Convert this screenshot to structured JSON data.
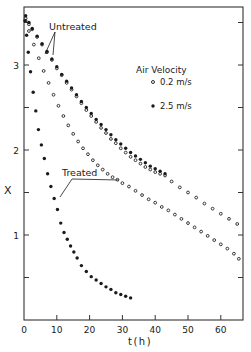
{
  "chart_data": {
    "type": "scatter",
    "title": "",
    "xlabel": "t(h)",
    "ylabel": "X",
    "xlim": [
      0,
      67
    ],
    "ylim": [
      0,
      3.7
    ],
    "xticks": [
      0,
      10,
      20,
      30,
      40,
      50,
      60
    ],
    "xtick_labels": [
      "0",
      "10",
      "20",
      "30",
      "40",
      "50",
      "60"
    ],
    "yticks": [
      0.5,
      1,
      1.5,
      2,
      2.5,
      3,
      3.5
    ],
    "ytick_labels": [
      "",
      "1",
      "",
      "2",
      "",
      "3",
      ""
    ],
    "grid": false,
    "legend": {
      "title": "Air Velocity",
      "position": "upper right",
      "entries": [
        {
          "label": "0.2 m/s",
          "marker": "open-circle"
        },
        {
          "label": "2.5 m/s",
          "marker": "filled-circle"
        }
      ]
    },
    "annotations": [
      {
        "text": "Untreated",
        "points_to": [
          "Untreated 0.2 m/s",
          "Untreated 2.5 m/s"
        ]
      },
      {
        "text": "Treated",
        "points_to": [
          "Treated 0.2 m/s",
          "Treated 2.5 m/s"
        ]
      }
    ],
    "series": [
      {
        "name": "Untreated 0.2 m/s",
        "marker": "open-circle",
        "x": [
          0.5,
          1.5,
          2.5,
          4,
          5.5,
          7,
          8.5,
          10,
          11.5,
          13,
          14.5,
          16,
          17.5,
          19,
          20.5,
          22,
          23.5,
          25,
          26.5,
          28,
          29.5,
          31,
          32.5,
          34,
          35.5,
          37,
          38.5,
          40,
          41.5,
          43,
          45,
          47.5,
          50,
          52.5,
          55,
          57.5,
          60,
          62.5,
          65
        ],
        "y": [
          3.55,
          3.48,
          3.42,
          3.33,
          3.24,
          3.15,
          3.06,
          2.96,
          2.88,
          2.79,
          2.71,
          2.63,
          2.55,
          2.47,
          2.4,
          2.33,
          2.26,
          2.2,
          2.13,
          2.08,
          2.02,
          1.97,
          1.92,
          1.88,
          1.84,
          1.8,
          1.77,
          1.74,
          1.72,
          1.7,
          1.63,
          1.56,
          1.5,
          1.44,
          1.37,
          1.31,
          1.25,
          1.19,
          1.13
        ]
      },
      {
        "name": "Untreated 2.5 m/s",
        "marker": "filled-circle",
        "x": [
          0.5,
          1.5,
          2.5,
          4,
          5.5,
          7,
          8.5,
          10,
          11.5,
          13,
          14.5,
          16,
          17.5,
          19,
          20.5,
          22,
          23.5,
          25,
          26.5,
          28,
          29.5,
          31,
          32.5,
          34,
          35.5,
          37,
          38.5,
          40,
          41.5,
          43
        ],
        "y": [
          3.58,
          3.5,
          3.43,
          3.34,
          3.25,
          3.16,
          3.07,
          2.98,
          2.89,
          2.81,
          2.73,
          2.65,
          2.57,
          2.5,
          2.43,
          2.36,
          2.3,
          2.24,
          2.18,
          2.12,
          2.07,
          2.02,
          1.97,
          1.93,
          1.89,
          1.85,
          1.81,
          1.78,
          1.75,
          1.72
        ]
      },
      {
        "name": "Treated 0.2 m/s",
        "marker": "open-circle",
        "x": [
          0.5,
          1.5,
          3,
          4.5,
          6,
          7.5,
          9,
          10.5,
          12,
          13.5,
          15,
          16.5,
          18,
          19.5,
          21,
          22.5,
          24,
          25.5,
          27,
          28.5,
          30,
          32,
          34,
          36,
          38,
          40,
          42,
          44,
          46,
          48,
          50,
          52,
          54,
          56,
          58,
          60,
          62,
          64,
          65.5
        ],
        "y": [
          3.52,
          3.4,
          3.24,
          3.08,
          2.93,
          2.79,
          2.65,
          2.52,
          2.4,
          2.29,
          2.19,
          2.1,
          2.02,
          1.95,
          1.88,
          1.82,
          1.77,
          1.72,
          1.68,
          1.65,
          1.61,
          1.57,
          1.52,
          1.47,
          1.42,
          1.38,
          1.33,
          1.29,
          1.24,
          1.19,
          1.14,
          1.09,
          1.04,
          0.99,
          0.94,
          0.89,
          0.84,
          0.78,
          0.72
        ]
      },
      {
        "name": "Treated 2.5 m/s",
        "marker": "filled-circle",
        "x": [
          0.3,
          0.8,
          1.3,
          2,
          2.8,
          3.6,
          4.4,
          5.3,
          6.2,
          7.2,
          8.2,
          9.2,
          10.2,
          11.2,
          12.2,
          13.2,
          14.2,
          15.2,
          16.2,
          17.5,
          19,
          20.5,
          22,
          23.5,
          25,
          26.5,
          28,
          29.5,
          31,
          32.5
        ],
        "y": [
          3.52,
          3.35,
          3.15,
          2.92,
          2.68,
          2.46,
          2.24,
          2.06,
          1.9,
          1.72,
          1.57,
          1.43,
          1.3,
          1.14,
          1.03,
          0.95,
          0.87,
          0.8,
          0.73,
          0.64,
          0.57,
          0.51,
          0.47,
          0.43,
          0.39,
          0.36,
          0.32,
          0.3,
          0.28,
          0.26
        ]
      }
    ]
  },
  "labels": {
    "untreated": "Untreated",
    "treated": "Treated",
    "legend_title": "Air Velocity",
    "legend_open": "0.2 m/s",
    "legend_filled": "2.5 m/s",
    "xlabel": "t(h)",
    "ylabel": "X"
  }
}
